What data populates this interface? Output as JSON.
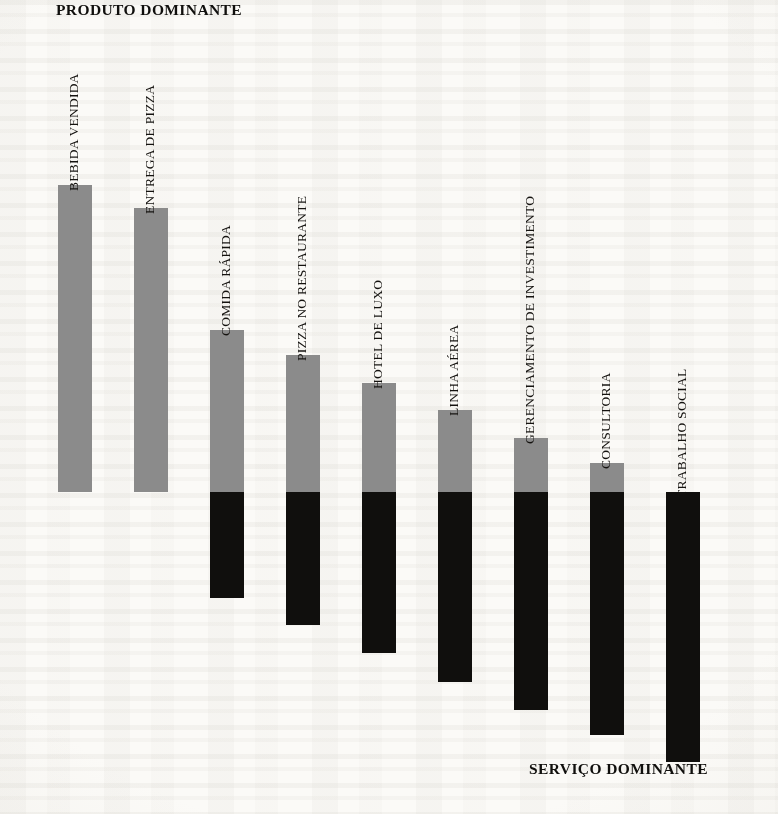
{
  "headings": {
    "product_axis": "PRODUTO DOMINANTE",
    "service_axis": "SERVIÇO DOMINANTE"
  },
  "chart_data": {
    "type": "bar",
    "title": "",
    "subtype": "stacked-divided-bar",
    "xlabel": "",
    "ylabel": "",
    "grid": false,
    "legend": false,
    "baseline_note": "Shared horizontal divider separates product share (above, gray) from service share (below, black).",
    "categories": [
      "BEBIDA VENDIDA",
      "ENTREGA DE PIZZA",
      "COMIDA RÁPIDA",
      "PIZZA NO RESTAURANTE",
      "HOTEL DE LUXO",
      "LINHA AÉREA",
      "GERENCIAMENTO DE INVESTIMENTO",
      "CONSULTORIA",
      "TRABALHO SOCIAL"
    ],
    "series": [
      {
        "name": "PRODUTO DOMINANTE",
        "color": "#8b8b8b",
        "values": [
          307,
          284,
          162,
          137,
          109,
          82,
          54,
          29,
          0
        ]
      },
      {
        "name": "SERVIÇO DOMINANTE",
        "color": "#100f0d",
        "values": [
          0,
          0,
          106,
          133,
          161,
          190,
          218,
          243,
          270
        ]
      }
    ],
    "bars": [
      {
        "label": "BEBIDA VENDIDA",
        "product": 307,
        "service": 0
      },
      {
        "label": "ENTREGA DE PIZZA",
        "product": 284,
        "service": 0
      },
      {
        "label": "COMIDA RÁPIDA",
        "product": 162,
        "service": 106
      },
      {
        "label": "PIZZA NO RESTAURANTE",
        "product": 137,
        "service": 133
      },
      {
        "label": "HOTEL DE LUXO",
        "product": 109,
        "service": 161
      },
      {
        "label": "LINHA AÉREA",
        "product": 82,
        "service": 190
      },
      {
        "label": "GERENCIAMENTO DE INVESTIMENTO",
        "product": 54,
        "service": 218
      },
      {
        "label": "CONSULTORIA",
        "product": 29,
        "service": 243
      },
      {
        "label": "TRABALHO SOCIAL",
        "product": 0,
        "service": 270
      }
    ]
  },
  "geometry": {
    "baseline_y": 492,
    "bar_width": 34,
    "bar_pitch": 76,
    "first_bar_x": 58,
    "label_gap": 10
  },
  "colors": {
    "product": "#8b8b8b",
    "service": "#100f0d",
    "paper": "#fbfaf7",
    "text": "#100f0d"
  }
}
